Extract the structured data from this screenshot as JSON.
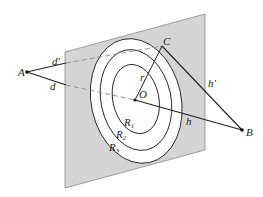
{
  "diagram": {
    "colors": {
      "plane_fill": "#d4d4d4",
      "plane_edge": "#888888",
      "zone_fill": "#ffffff",
      "line": "#222222",
      "dashed": "#8a8a8a"
    },
    "points": {
      "A": {
        "label": "A",
        "x": 27,
        "y": 72
      },
      "B": {
        "label": "B",
        "x": 242,
        "y": 130
      },
      "C": {
        "label": "C",
        "x": 162,
        "y": 46
      },
      "O": {
        "label": "O",
        "x": 135,
        "y": 100
      }
    },
    "segments": {
      "d_prime": {
        "label": "d'"
      },
      "d": {
        "label": "d"
      },
      "h_prime": {
        "label": "h'"
      },
      "h": {
        "label": "h"
      },
      "r": {
        "label": "r"
      }
    },
    "zones": [
      {
        "label": "R",
        "sub": "1"
      },
      {
        "label": "R",
        "sub": "2"
      },
      {
        "label": "R",
        "sub": "3"
      }
    ]
  }
}
